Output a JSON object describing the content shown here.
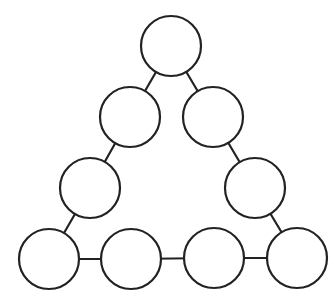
{
  "diagram": {
    "type": "triangle-circle-arrangement",
    "colors": {
      "background": "#ffffff",
      "stroke": "#222222",
      "fill": "#ffffff"
    },
    "node_radius": 30,
    "nodes": [
      {
        "id": "top",
        "cx": 171,
        "cy": 46,
        "label": ""
      },
      {
        "id": "left-upper",
        "cx": 130,
        "cy": 117,
        "label": ""
      },
      {
        "id": "right-upper",
        "cx": 213,
        "cy": 117,
        "label": ""
      },
      {
        "id": "left-lower",
        "cx": 90,
        "cy": 188,
        "label": ""
      },
      {
        "id": "right-lower",
        "cx": 255,
        "cy": 188,
        "label": ""
      },
      {
        "id": "bottom-1",
        "cx": 49,
        "cy": 259,
        "label": ""
      },
      {
        "id": "bottom-2",
        "cx": 131,
        "cy": 259,
        "label": ""
      },
      {
        "id": "bottom-3",
        "cx": 214,
        "cy": 258,
        "label": ""
      },
      {
        "id": "bottom-4",
        "cx": 297,
        "cy": 258,
        "label": ""
      }
    ],
    "edges": [
      [
        "top",
        "left-upper"
      ],
      [
        "top",
        "right-upper"
      ],
      [
        "left-upper",
        "left-lower"
      ],
      [
        "right-upper",
        "right-lower"
      ],
      [
        "left-lower",
        "bottom-1"
      ],
      [
        "right-lower",
        "bottom-4"
      ],
      [
        "bottom-1",
        "bottom-2"
      ],
      [
        "bottom-2",
        "bottom-3"
      ],
      [
        "bottom-3",
        "bottom-4"
      ]
    ]
  }
}
